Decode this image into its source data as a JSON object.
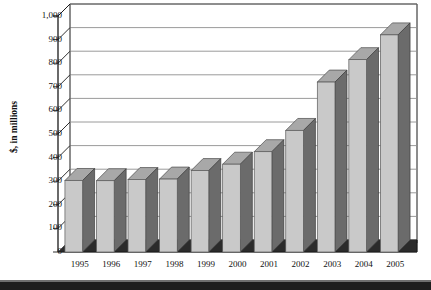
{
  "chart_data": {
    "type": "bar",
    "title": "",
    "subtitle": "",
    "xlabel": "",
    "ylabel": "$, in millions",
    "categories": [
      "1995",
      "1996",
      "1997",
      "1998",
      "1999",
      "2000",
      "2001",
      "2002",
      "2003",
      "2004",
      "2005"
    ],
    "values": [
      303,
      302,
      307,
      309,
      345,
      372,
      425,
      515,
      720,
      815,
      920
    ],
    "series": [
      {
        "name": "Revenue",
        "values": [
          303,
          302,
          307,
          309,
          345,
          372,
          425,
          515,
          720,
          815,
          920
        ]
      }
    ],
    "ylim": [
      0,
      1000
    ],
    "ytick_values": [
      0,
      100,
      200,
      300,
      400,
      500,
      600,
      700,
      800,
      900,
      1000
    ],
    "ytick_labels": [
      "0",
      "100",
      "200",
      "300",
      "400",
      "500",
      "600",
      "700",
      "800",
      "900",
      "1,000"
    ],
    "grid": true,
    "legend": false,
    "legend_position": "none",
    "style": "3d-column",
    "colors": {
      "bar_face": "#c9c9c9",
      "bar_side": "#6b6b6b",
      "bar_top": "#a8a8a8",
      "floor": "#2b2b2b",
      "axis": "#1a1a1a",
      "grid": "#8f8f8f",
      "text": "#111111",
      "background": "#ffffff"
    }
  },
  "axis": {
    "y_title": "$, in millions"
  }
}
